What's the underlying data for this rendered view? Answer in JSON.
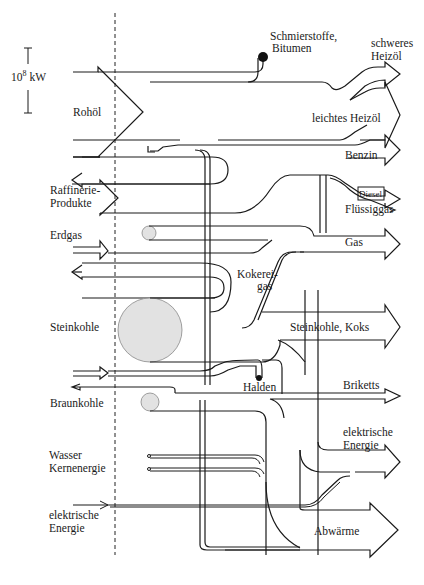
{
  "scale": {
    "label_base": "10",
    "label_exp": "8",
    "label_unit": " kW"
  },
  "inputs": {
    "rohoel": "Rohöl",
    "raffinerie_1": "Raffinerie-",
    "raffinerie_2": "Produkte",
    "erdgas": "Erdgas",
    "steinkohle": "Steinkohle",
    "braunkohle": "Braunkohle",
    "wasser": "Wasser",
    "kernenergie": "Kernenergie",
    "elektrische_1": "elektrische",
    "elektrische_2": "Energie"
  },
  "intermediate": {
    "schmierstoffe_1": "Schmierstoffe,",
    "schmierstoffe_2": "Bitumen",
    "kokerei_1": "Kokerei-",
    "kokerei_2": "gas",
    "halden": "Halden"
  },
  "outputs": {
    "schweres_1": "schweres",
    "schweres_2": "Heizöl",
    "leichtes": "leichtes Heizöl",
    "benzin": "Benzin",
    "diesel": "Diesel",
    "fluessiggas": "Flüssiggas",
    "gas": "Gas",
    "steinkohle_koks": "Steinkohle, Koks",
    "briketts": "Briketts",
    "elektrische_1": "elektrische",
    "elektrische_2": "Energie",
    "abwaerme": "Abwärme"
  },
  "colors": {
    "line": "#1a1a1a",
    "blob_fill": "#e2e2e2",
    "background": "#ffffff"
  }
}
